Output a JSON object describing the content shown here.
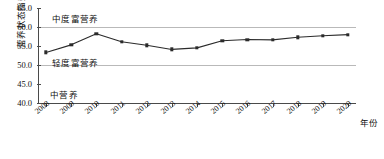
{
  "chart_data": {
    "type": "line",
    "title": "",
    "xlabel": "年份",
    "ylabel": "营养状态指数",
    "categories": [
      "2008",
      "2009",
      "2010",
      "2011",
      "2012",
      "2013",
      "2014",
      "2015",
      "2016",
      "2017",
      "2018",
      "2019",
      "2020"
    ],
    "values": [
      53.3,
      55.3,
      58.2,
      56.1,
      55.2,
      54.1,
      54.5,
      56.4,
      56.7,
      56.6,
      57.3,
      57.7,
      58.0
    ],
    "series": [
      {
        "name": "营养状态指数",
        "values": [
          53.3,
          55.3,
          58.2,
          56.1,
          55.2,
          54.1,
          54.5,
          56.4,
          56.7,
          56.6,
          57.3,
          57.7,
          58.0
        ]
      }
    ],
    "ylim": [
      40.0,
      65.0
    ],
    "yticks": [
      "40.0",
      "45.0",
      "50.0",
      "55.0",
      "60.0",
      "65.0"
    ],
    "ytick_values": [
      40.0,
      45.0,
      50.0,
      55.0,
      60.0,
      65.0
    ],
    "gridlines": [
      50.0,
      60.0
    ],
    "grid": true,
    "legend": "none",
    "marker": "square",
    "line_color": "#2b2b2b",
    "grid_color": "#b9b9b9",
    "axis_color": "#4a4a4a",
    "annotations": [
      {
        "text": "中度富营养",
        "band": [
          60.0,
          65.0
        ]
      },
      {
        "text": "轻度富营养",
        "band": [
          50.0,
          60.0
        ]
      },
      {
        "text": "中营养",
        "band": [
          40.0,
          50.0
        ]
      }
    ]
  }
}
